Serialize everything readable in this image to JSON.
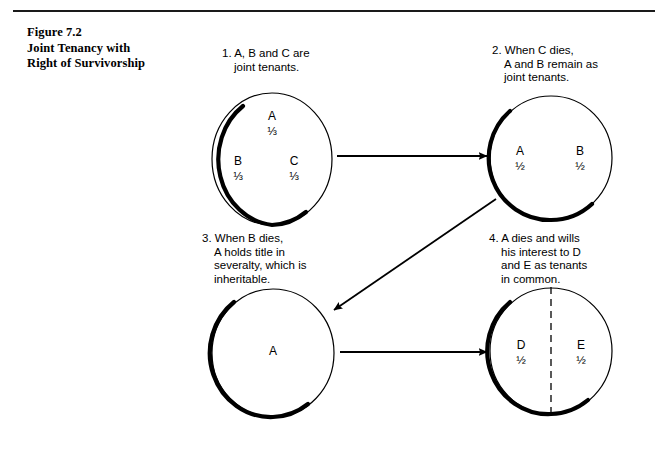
{
  "figure": {
    "title_lines": [
      "Figure 7.2",
      "Joint Tenancy with",
      "Right of Survivorship"
    ],
    "rule_color": "#1a1a1a"
  },
  "steps": [
    {
      "id": "step-1",
      "caption_lines": [
        "1. A, B and C are",
        "joint tenants."
      ],
      "circle": {
        "divider": "none",
        "shadow": "left-bottom",
        "cells": [
          {
            "owner": "A",
            "share": "⅓"
          },
          {
            "owner": "B",
            "share": "⅓"
          },
          {
            "owner": "C",
            "share": "⅓"
          }
        ]
      }
    },
    {
      "id": "step-2",
      "caption_lines": [
        "2. When C dies,",
        "A and B remain as",
        "joint tenants."
      ],
      "circle": {
        "divider": "none",
        "shadow": "left-bottom",
        "cells": [
          {
            "owner": "A",
            "share": "½"
          },
          {
            "owner": "B",
            "share": "½"
          }
        ]
      }
    },
    {
      "id": "step-3",
      "caption_lines": [
        "3. When B dies,",
        "A holds title in",
        "severalty, which is",
        "inheritable."
      ],
      "circle": {
        "divider": "none",
        "shadow": "left-bottom",
        "cells": [
          {
            "owner": "A",
            "share": ""
          }
        ]
      }
    },
    {
      "id": "step-4",
      "caption_lines": [
        "4. A dies and wills",
        "his interest to D",
        "and E as tenants",
        "in common."
      ],
      "circle": {
        "divider": "vertical-dashed",
        "shadow": "left-bottom",
        "cells": [
          {
            "owner": "D",
            "share": "½"
          },
          {
            "owner": "E",
            "share": "½"
          }
        ]
      }
    }
  ],
  "arrows": [
    {
      "name": "arrow-step1-to-step2",
      "direction": "right"
    },
    {
      "name": "arrow-step2-to-step3",
      "direction": "down-left"
    },
    {
      "name": "arrow-step3-to-step4",
      "direction": "right"
    }
  ],
  "colors": {
    "ink": "#000000",
    "background": "#ffffff"
  }
}
